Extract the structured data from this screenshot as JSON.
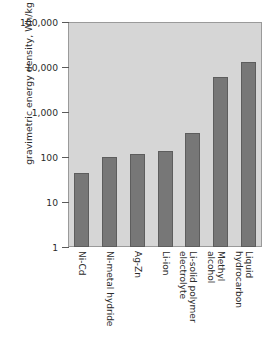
{
  "chart_data": {
    "type": "bar",
    "title": "",
    "xlabel": "",
    "ylabel": "gravimetric energy density, Wh/kg",
    "yscale": "log",
    "ylim": [
      1,
      100000
    ],
    "grid": false,
    "legend": false,
    "ytick_labels": [
      "100,000",
      "10,000",
      "1,000",
      "100",
      "10",
      "1"
    ],
    "ytick_values": [
      100000,
      10000,
      1000,
      100,
      10,
      1
    ],
    "categories": [
      "Ni-Cd",
      "Ni-metal hydride",
      "Ag-Zn",
      "Li-ion",
      "Li-solid polymer electrolyte",
      "Methyl alcohol",
      "Liquid hydrocarbon"
    ],
    "category_lines": [
      [
        "Ni-Cd"
      ],
      [
        "Ni-metal hydride"
      ],
      [
        "Ag-Zn"
      ],
      [
        "Li-ion"
      ],
      [
        "Li-solid polymer",
        "electrolyte"
      ],
      [
        "Methyl",
        "alcohol"
      ],
      [
        "Liquid",
        "hydrocarbon"
      ]
    ],
    "values": [
      44,
      100,
      115,
      133,
      340,
      6000,
      13000
    ],
    "colors": {
      "bar_fill": "#777777",
      "bar_edge": "#5d5d5d",
      "plot_background": "#d6d6d6",
      "axis": "#9a9a9a",
      "text": "#2b2b2b",
      "figure_background": "#ffffff"
    }
  }
}
